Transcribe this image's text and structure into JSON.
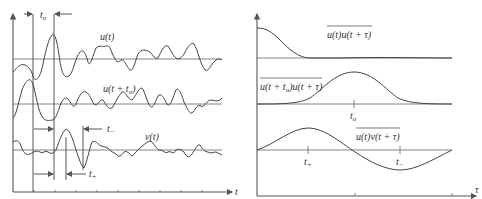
{
  "left_panel": {
    "x_axis_label": "t",
    "signals": [
      {
        "id": "u",
        "label": "u(t)"
      },
      {
        "id": "u_shift",
        "label_main": "u(t + t",
        "label_sub": "o",
        "label_tail": ")"
      },
      {
        "id": "v",
        "label": "v(t)"
      }
    ],
    "markers": {
      "t_o": {
        "main": "t",
        "sub": "o"
      },
      "t_minus": {
        "main": "t",
        "sub": "−"
      },
      "t_plus": {
        "main": "t",
        "sub": "+"
      }
    }
  },
  "right_panel": {
    "x_axis_label": "τ",
    "curves": [
      {
        "id": "autocorr",
        "label": "u(t)u(t + τ)"
      },
      {
        "id": "shifted_corr",
        "label_a": "u(t + t",
        "label_sub": "o",
        "label_b": ")u(t + τ)",
        "tick_main": "t",
        "tick_sub": "o"
      },
      {
        "id": "crosscorr",
        "label": "u(t)v(t + τ)",
        "tick_plus_main": "t",
        "tick_plus_sub": "+",
        "tick_minus_main": "t",
        "tick_minus_sub": "−"
      }
    ]
  }
}
